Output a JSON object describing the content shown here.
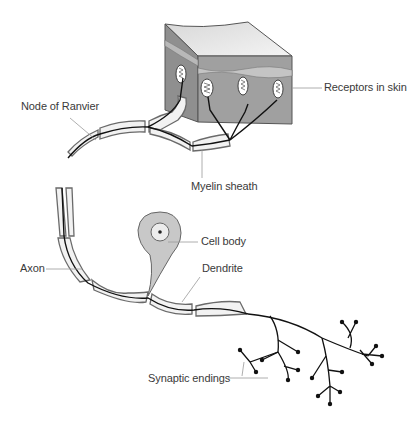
{
  "diagram": {
    "labels": {
      "receptors": "Receptors in skin",
      "node_of_ranvier": "Node of Ranvier",
      "myelin_sheath": "Myelin sheath",
      "axon": "Axon",
      "cell_body": "Cell body",
      "dendrite": "Dendrite",
      "synaptic_endings": "Synaptic endings"
    },
    "colors": {
      "skin_top": "#e6e6e6",
      "skin_front": "#9a9a9a",
      "skin_side": "#8c8c8c",
      "sheath_fill": "#f2f2f2",
      "sheath_stroke": "#6a6a6a",
      "axon_line": "#111111",
      "cell_body_fill": "#c8c8c8",
      "leader_line": "#9a9a9a",
      "label_text": "#3a3a3a"
    }
  }
}
